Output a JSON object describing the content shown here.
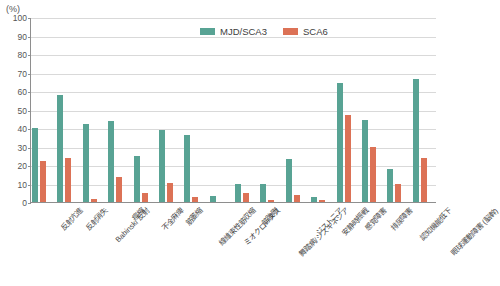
{
  "axis": {
    "unit_label": "(%)",
    "y_ticks": [
      0,
      10,
      20,
      30,
      40,
      50,
      60,
      70,
      80,
      90,
      100
    ]
  },
  "legend": {
    "items": [
      {
        "label": "MJD/SCA3",
        "color": "#58a394"
      },
      {
        "label": "SCA6",
        "color": "#dc7256"
      }
    ]
  },
  "chart_data": {
    "type": "bar",
    "title": "",
    "xlabel": "",
    "ylabel": "(%)",
    "ylim": [
      0,
      100
    ],
    "grid": true,
    "legend_position": "top-center",
    "categories": [
      "反射亢進",
      "反射消失",
      "Babinski 反射",
      "痙縮",
      "不全麻痺",
      "筋萎縮",
      "線維束性筋収縮",
      "ミオクローヌス",
      "筋強剛",
      "舞踏病/ジスキネジア",
      "ジストニア",
      "安静時振戦",
      "感覚障害",
      "排尿障害",
      "認知機能低下",
      "眼球運動障害 (脳幹)"
    ],
    "series": [
      {
        "name": "MJD/SCA3",
        "color": "#58a394",
        "values": [
          40,
          58,
          42,
          44,
          25,
          39,
          36,
          3.5,
          10,
          9.5,
          23,
          2.5,
          64.5,
          44.5,
          18,
          66.5
        ]
      },
      {
        "name": "SCA6",
        "color": "#dc7256",
        "values": [
          22,
          24,
          1.5,
          13.5,
          5,
          10.5,
          2.5,
          0,
          5,
          1,
          4,
          1,
          47,
          30,
          9.5,
          24
        ]
      }
    ]
  }
}
